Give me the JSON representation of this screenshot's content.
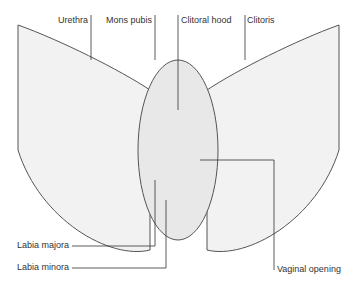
{
  "diagram": {
    "type": "anatomical-labeled-illustration",
    "labels": {
      "urethra": "Urethra",
      "mons_pubis": "Mons pubis",
      "clitoral_hood": "Clitoral hood",
      "clitoris": "Clitoris",
      "labia_majora": "Labia majora",
      "labia_minora": "Labia minora",
      "vaginal_opening": "Vaginal opening"
    }
  }
}
